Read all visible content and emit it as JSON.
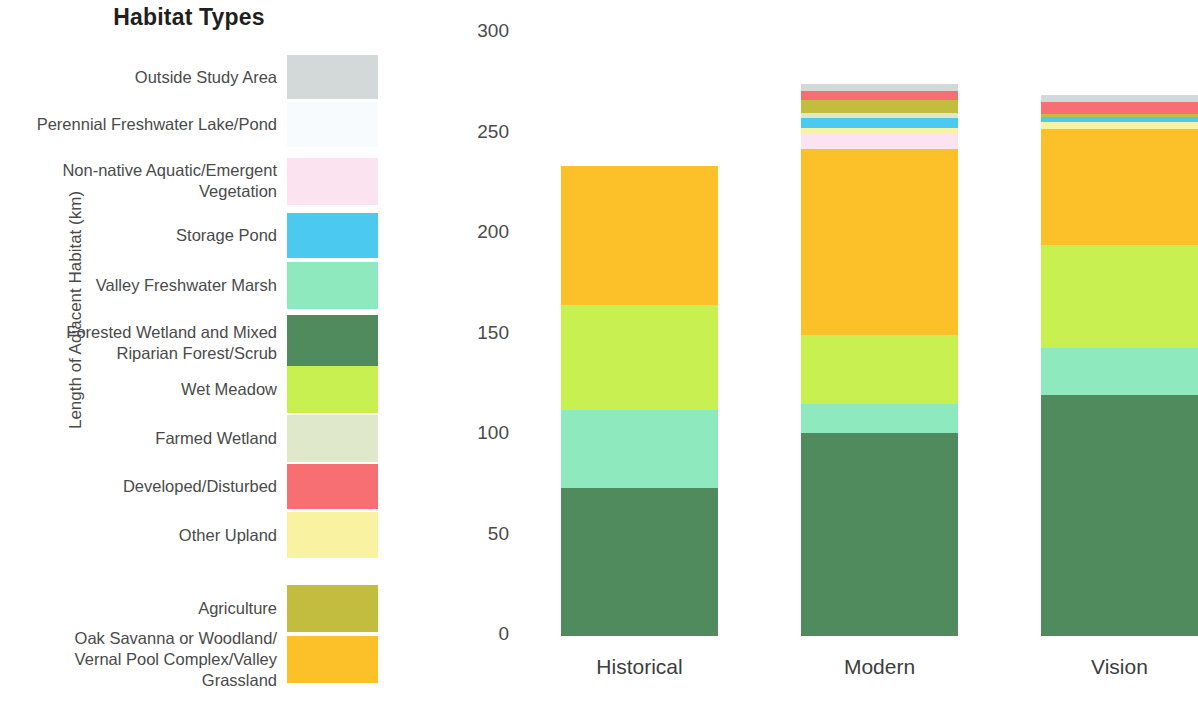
{
  "legend": {
    "title": "Habitat Types",
    "items": [
      {
        "label": "Outside Study Area",
        "color": "#d3d9d9"
      },
      {
        "label": "Perennial Freshwater Lake/Pond",
        "color": "#f7fbfd"
      },
      {
        "label": "Non-native Aquatic/Emergent\nVegetation",
        "color": "#fbe4ef"
      },
      {
        "label": "Storage Pond",
        "color": "#4cc9ef"
      },
      {
        "label": "Valley Freshwater Marsh",
        "color": "#8ee9bf"
      },
      {
        "label": "Forested Wetland and Mixed\nRiparian Forest/Scrub",
        "color": "#4f8b5c"
      },
      {
        "label": "Wet Meadow",
        "color": "#c9f051"
      },
      {
        "label": "Farmed Wetland",
        "color": "#dfe8ca"
      },
      {
        "label": "Developed/Disturbed",
        "color": "#f76f72"
      },
      {
        "label": "Other Upland",
        "color": "#f9f3a1"
      },
      {
        "label": "Agriculture",
        "color": "#c3bd3f"
      },
      {
        "label": "Oak Savanna or Woodland/\nVernal Pool Complex/Valley\nGrassland",
        "color": "#fcc028"
      }
    ]
  },
  "chart_data": {
    "type": "bar",
    "stacked": true,
    "title": "",
    "xlabel": "",
    "ylabel": "Length of Adjacent Habitat (km)",
    "ylim": [
      0,
      300
    ],
    "yticks": [
      0,
      50,
      100,
      150,
      200,
      250,
      300
    ],
    "ytick_labels": [
      "0",
      "50",
      "100",
      "150",
      "200",
      "250",
      "300"
    ],
    "grid": false,
    "legend_position": "left",
    "categories": [
      "Historical",
      "Modern",
      "Vision"
    ],
    "series": [
      {
        "name": "Forested Wetland and Mixed Riparian Forest/Scrub",
        "color": "#4f8b5c",
        "values": [
          73.5,
          101.0,
          120.0
        ]
      },
      {
        "name": "Valley Freshwater Marsh",
        "color": "#8ee9bf",
        "values": [
          39.0,
          14.5,
          23.5
        ]
      },
      {
        "name": "Wet Meadow",
        "color": "#c9f051",
        "values": [
          52.0,
          34.5,
          51.0
        ]
      },
      {
        "name": "Oak Savanna or Woodland/Vernal Pool Complex/Valley Grassland",
        "color": "#fcc028",
        "values": [
          69.5,
          92.5,
          58.0
        ]
      },
      {
        "name": "Non-native Aquatic/Emergent Vegetation",
        "color": "#fbe4ef",
        "values": [
          0,
          7.5,
          0
        ]
      },
      {
        "name": "Perennial Freshwater Lake/Pond",
        "color": "#f7fbfd",
        "values": [
          0,
          0,
          0
        ]
      },
      {
        "name": "Other Upland",
        "color": "#f9f3a1",
        "values": [
          0,
          3.0,
          3.0
        ]
      },
      {
        "name": "Storage Pond",
        "color": "#4cc9ef",
        "values": [
          0,
          4.5,
          2.5
        ]
      },
      {
        "name": "Farmed Wetland",
        "color": "#dfe8ca",
        "values": [
          0,
          2.5,
          0
        ]
      },
      {
        "name": "Agriculture",
        "color": "#c3bd3f",
        "values": [
          0,
          6.5,
          1.5
        ]
      },
      {
        "name": "Developed/Disturbed",
        "color": "#f76f72",
        "values": [
          0,
          4.5,
          6.0
        ]
      },
      {
        "name": "Outside Study Area",
        "color": "#d3d9d9",
        "values": [
          0,
          3.5,
          3.5
        ]
      }
    ],
    "totals": [
      234.0,
      274.5,
      269.0
    ]
  }
}
